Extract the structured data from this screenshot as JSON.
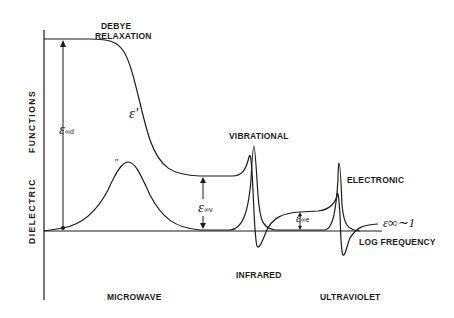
{
  "title_labels": {
    "debye_line1": "DEBYE",
    "debye_line2": "RELAXATION",
    "vibrational": "VIBRATIONAL",
    "electronic": "ELECTRONIC"
  },
  "axes": {
    "y_label_top": "FUNCTIONS",
    "y_label_bottom": "DIELECTRIC",
    "x_label": "LOG FREQUENCY"
  },
  "regions": {
    "microwave": "MICROWAVE",
    "infrared": "INFRARED",
    "ultraviolet": "ULTRAVIOLET"
  },
  "symbols": {
    "eps_prime": "ε'",
    "eps_double_prime": "\"",
    "eps_inf_d": "ε",
    "eps_inf_d_sub": "∞d",
    "eps_inf_v": "ε",
    "eps_inf_v_sub": "∞v",
    "eps_inf_e": "ε",
    "eps_inf_e_sub": "∞e",
    "eps_inf_approx": "ε∞∼1"
  },
  "colors": {
    "ink": "#1c1c1c",
    "background": "#ffffff"
  }
}
